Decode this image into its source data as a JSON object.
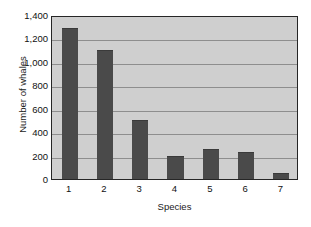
{
  "chart_data": {
    "type": "bar",
    "title": "",
    "subtitle": "",
    "xlabel": "Species",
    "ylabel": "Number of whales",
    "categories": [
      "1",
      "2",
      "3",
      "4",
      "5",
      "6",
      "7"
    ],
    "values": [
      1290,
      1100,
      500,
      200,
      260,
      230,
      50
    ],
    "series": [
      {
        "name": "Number of whales",
        "values": [
          1290,
          1100,
          500,
          200,
          260,
          230,
          50
        ]
      }
    ],
    "ylim": [
      0,
      1400
    ],
    "yticks": [
      0,
      200,
      400,
      600,
      800,
      1000,
      1200,
      1400
    ],
    "ytick_labels": [
      "0",
      "200",
      "400",
      "600",
      "800",
      "1,000",
      "1,200",
      "1,400"
    ],
    "xtick_labels": [
      "1",
      "2",
      "3",
      "4",
      "5",
      "6",
      "7"
    ],
    "grid": "horizontal",
    "legend": "none",
    "annotations": [],
    "colors": {
      "bar": "#4a4a4a",
      "plot_background": "#cfcfcf",
      "gridline": "#8e8e8e",
      "frame": "#262626",
      "text": "#111111",
      "page_background": "#ffffff"
    }
  }
}
